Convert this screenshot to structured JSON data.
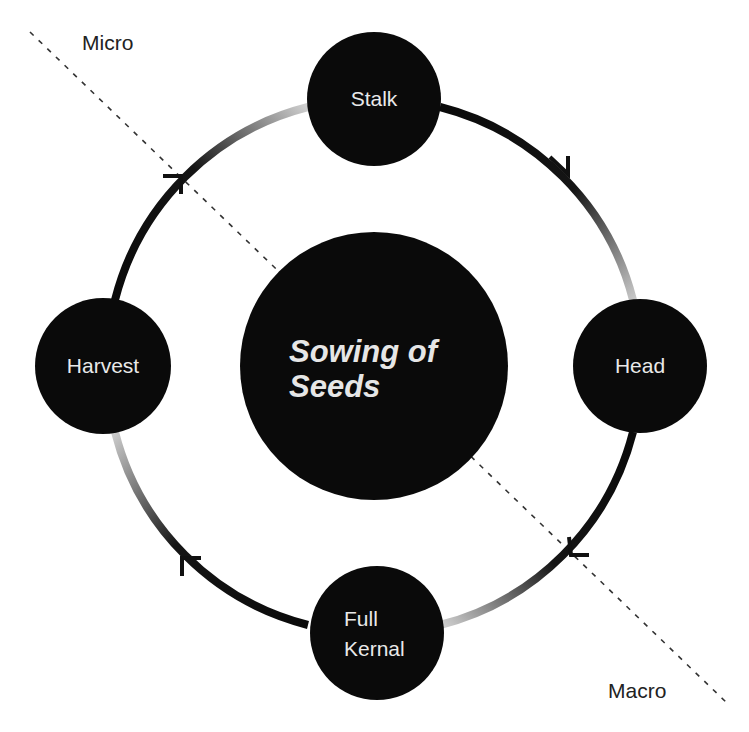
{
  "diagram": {
    "center": {
      "line1": "Sowing of",
      "line2": "Seeds"
    },
    "zones": {
      "upper_left": "Micro",
      "lower_right": "Macro"
    },
    "nodes": [
      {
        "id": "stalk",
        "label": "Stalk"
      },
      {
        "id": "head",
        "label": "Head"
      },
      {
        "id": "full-kernal",
        "line1": "Full",
        "line2": "Kernal"
      },
      {
        "id": "harvest",
        "label": "Harvest"
      }
    ],
    "flow_direction": "clockwise",
    "cycle_order": [
      "Stalk",
      "Head",
      "Full Kernal",
      "Harvest"
    ],
    "colors": {
      "node_fill": "#0a0a0a",
      "node_text": "#e9e9e9",
      "arc_start": "#0a0a0a",
      "arc_end": "#c8c8c8",
      "divider": "#333333"
    }
  }
}
